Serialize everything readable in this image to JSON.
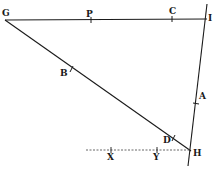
{
  "diagram": {
    "type": "geometric-figure",
    "stroke_color": "#1a1a1a",
    "points": {
      "G": {
        "label": "G",
        "x": 5,
        "y": 20
      },
      "P": {
        "label": "P",
        "x": 91,
        "y": 20
      },
      "C": {
        "label": "C",
        "x": 172,
        "y": 19
      },
      "I": {
        "label": "I",
        "x": 205,
        "y": 19
      },
      "B": {
        "label": "B",
        "x": 71,
        "y": 69
      },
      "A": {
        "label": "A",
        "x": 196,
        "y": 103
      },
      "D": {
        "label": "D",
        "x": 173,
        "y": 138
      },
      "H": {
        "label": "H",
        "x": 190,
        "y": 150
      },
      "X": {
        "label": "X",
        "x": 111,
        "y": 150
      },
      "Y": {
        "label": "Y",
        "x": 157,
        "y": 150
      }
    },
    "segments": [
      {
        "from": "G",
        "to": "I",
        "style": "solid"
      },
      {
        "from": "G",
        "to": "H",
        "style": "solid"
      },
      {
        "from": "I",
        "to": "H",
        "style": "solid",
        "extends": true
      },
      {
        "from": "X",
        "to": "H",
        "style": "dotted"
      }
    ],
    "labels": [
      "G",
      "P",
      "C",
      "I",
      "B",
      "A",
      "D",
      "H",
      "X",
      "Y"
    ]
  }
}
